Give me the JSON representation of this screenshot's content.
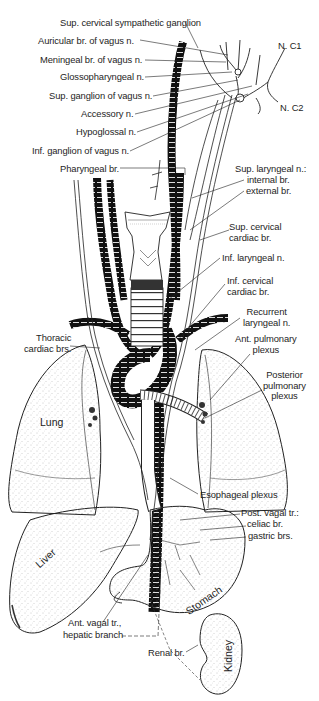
{
  "figure": {
    "labels_left": [
      {
        "id": "sup-cervical-sympathetic-ganglion",
        "text": "Sup. cervical sympathetic ganglion",
        "x": 64,
        "y": 17
      },
      {
        "id": "auricular-br",
        "text": "Auricular br. of vagus n.",
        "x": 39,
        "y": 36
      },
      {
        "id": "meningeal-br",
        "text": "Meningeal br. of vagus n.",
        "x": 40,
        "y": 55
      },
      {
        "id": "glossopharyngeal-n",
        "text": "Glossopharyngeal n.",
        "x": 60,
        "y": 73
      },
      {
        "id": "sup-ganglion-vagus",
        "text": "Sup. ganglion of vagus n.",
        "x": 49,
        "y": 92
      },
      {
        "id": "accessory-n",
        "text": "Accessory n.",
        "x": 81,
        "y": 110
      },
      {
        "id": "hypoglossal-n",
        "text": "Hypoglossal n.",
        "x": 76,
        "y": 128
      },
      {
        "id": "inf-ganglion-vagus",
        "text": "Inf. ganglion of vagus n.",
        "x": 32,
        "y": 147
      },
      {
        "id": "pharyngeal-br",
        "text": "Pharyngeal br.",
        "x": 60,
        "y": 165
      },
      {
        "id": "thoracic-cardiac-brs",
        "text": "Thoracic\ncardiac brs.",
        "x": 25,
        "y": 333
      }
    ],
    "labels_right": [
      {
        "id": "n-c1",
        "text": "N. C1",
        "x": 279,
        "y": 42
      },
      {
        "id": "n-c2",
        "text": "N. C2",
        "x": 281,
        "y": 104
      },
      {
        "id": "sup-laryngeal-n",
        "text": "Sup. laryngeal n.:",
        "x": 235,
        "y": 164
      },
      {
        "id": "internal-br",
        "text": "internal br.",
        "x": 247,
        "y": 175
      },
      {
        "id": "external-br",
        "text": "external br.",
        "x": 246,
        "y": 186
      },
      {
        "id": "sup-cervical-cardiac-br",
        "text": "Sup. cervical\ncardiac br.",
        "x": 229,
        "y": 222
      },
      {
        "id": "inf-laryngeal-n",
        "text": "Inf. laryngeal n.",
        "x": 222,
        "y": 255
      },
      {
        "id": "inf-cervical-cardiac-br",
        "text": "Inf. cervical\ncardiac br.",
        "x": 227,
        "y": 276
      },
      {
        "id": "recurrent-laryngeal-n",
        "text": "Recurrent\nlaryngeal n.",
        "x": 243,
        "y": 307
      },
      {
        "id": "ant-pulmonary-plexus",
        "text": "Ant. pulmonary\nplexus",
        "x": 235,
        "y": 335
      },
      {
        "id": "posterior-pulmonary-plexus",
        "text": "Posterior\npulmonary\nplexus",
        "x": 263,
        "y": 373
      },
      {
        "id": "esophageal-plexus",
        "text": "Esophageal plexus",
        "x": 200,
        "y": 491
      },
      {
        "id": "post-vagal-tr",
        "text": "Post. vagal tr.:",
        "x": 241,
        "y": 511
      },
      {
        "id": "celiac-br",
        "text": "celiac br.",
        "x": 247,
        "y": 522
      },
      {
        "id": "gastric-brs",
        "text": "gastric brs.",
        "x": 248,
        "y": 534
      }
    ],
    "labels_bottom": [
      {
        "id": "ant-vagal-tr",
        "text": "Ant. vagal tr.,",
        "x": 68,
        "y": 620
      },
      {
        "id": "hepatic-branch",
        "text": "hepatic branch",
        "x": 63,
        "y": 632
      },
      {
        "id": "renal-br",
        "text": "Renal br.",
        "x": 148,
        "y": 650
      }
    ],
    "organs": [
      {
        "id": "lung",
        "text": "Lung",
        "x": 40,
        "y": 416,
        "rotate": 0
      },
      {
        "id": "liver",
        "text": "Liver",
        "x": 35,
        "y": 552,
        "rotate": -42
      },
      {
        "id": "stomach",
        "text": "Stomach",
        "x": 185,
        "y": 592,
        "rotate": -35
      },
      {
        "id": "kidney",
        "text": "Kidney",
        "x": 216,
        "y": 650,
        "rotate": -90
      }
    ],
    "colors": {
      "ink": "#111111",
      "paper": "#ffffff",
      "stipple": "#9a9a9a",
      "vessel": "#121212"
    }
  }
}
